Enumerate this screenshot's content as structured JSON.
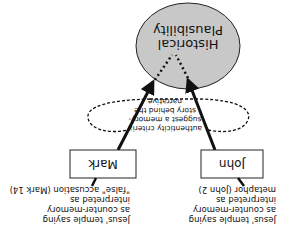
{
  "orientation": "rotated-180",
  "colors": {
    "circle_fill": "#c8c8c8",
    "stroke": "#111111",
    "background": "#ffffff"
  },
  "nodes": {
    "historical_plausibility": {
      "line1": "Historical",
      "line2": "Plausibility"
    },
    "mark": {
      "label": "Mark"
    },
    "john": {
      "label": "John"
    }
  },
  "annotations": {
    "mark_note": {
      "line1": "Jesus' temple saying",
      "line2": "as counter-memory",
      "line3": "interpreted as",
      "line4": "\"false\" accusation (Mark 14)"
    },
    "john_note": {
      "line1": "Jesus' temple saying",
      "line2": "as counter-memory",
      "line3": "interpreted as",
      "line4": "metaphor (John 2)"
    },
    "criteria_note": {
      "line1": "authenticity criteria",
      "line2": "suggest a memory-",
      "line3": "story behind the",
      "line4": "narrative"
    }
  }
}
